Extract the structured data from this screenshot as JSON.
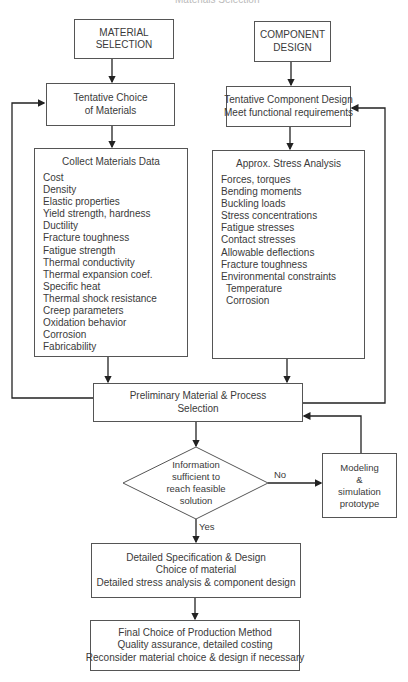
{
  "header_fragment": "Materials Selection",
  "start_nodes": {
    "material_selection": {
      "line1": "MATERIAL",
      "line2": "SELECTION"
    },
    "component_design": {
      "line1": "COMPONENT",
      "line2": "DESIGN"
    }
  },
  "tentative_materials": {
    "line1": "Tentative Choice",
    "line2": "of Materials"
  },
  "tentative_component": {
    "line1": "Tentative Component Design",
    "line2": "Meet functional requirements"
  },
  "materials_data": {
    "title": "Collect Materials Data",
    "items": [
      "Cost",
      "Density",
      "Elastic properties",
      "Yield strength, hardness",
      "Ductility",
      "Fracture toughness",
      "Fatigue strength",
      "Thermal conductivity",
      "Thermal expansion coef.",
      "Specific heat",
      "Thermal shock resistance",
      "Creep parameters",
      "Oxidation behavior",
      "Corrosion",
      "Fabricability"
    ]
  },
  "stress_analysis": {
    "title": "Approx. Stress Analysis",
    "items": [
      "Forces, torques",
      "Bending moments",
      "Buckling loads",
      "Stress concentrations",
      "Fatigue stresses",
      "Contact stresses",
      "Allowable deflections",
      "Fracture toughness",
      "Environmental constraints"
    ],
    "sub_items": [
      "Temperature",
      "Corrosion"
    ]
  },
  "preliminary": {
    "line1": "Preliminary Material & Process",
    "line2": "Selection"
  },
  "decision": {
    "line1": "Information",
    "line2": "sufficient to",
    "line3": "reach feasible",
    "line4": "solution",
    "no_label": "No",
    "yes_label": "Yes"
  },
  "modeling": {
    "line1": "Modeling",
    "line2": "&",
    "line3": "simulation",
    "line4": "prototype"
  },
  "detailed_spec": {
    "line1": "Detailed Specification & Design",
    "line2": "Choice of material",
    "line3": "Detailed stress analysis & component design"
  },
  "final_choice": {
    "line1": "Final Choice of Production Method",
    "line2": "Quality assurance, detailed costing",
    "line3": "Reconsider material choice & design if necessary"
  },
  "colors": {
    "stroke": "#555555",
    "arrow": "#222222",
    "text": "#3a3a3a",
    "background": "#ffffff"
  }
}
